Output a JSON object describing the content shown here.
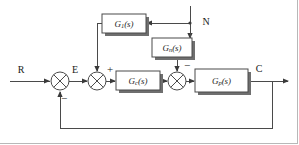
{
  "diagram": {
    "type": "control-system-block-diagram",
    "signals": {
      "reference": "R",
      "error": "E",
      "output": "C",
      "disturbance": "N"
    },
    "blocks": [
      {
        "id": "g1",
        "name": "feedforward-compensator-block",
        "label_main": "G",
        "label_sub": "1",
        "label_arg": "(s)",
        "x": 102,
        "y": 14,
        "w": 44,
        "h": 19
      },
      {
        "id": "gn",
        "name": "disturbance-transfer-block",
        "label_main": "G",
        "label_sub": "n",
        "label_arg": "(s)",
        "x": 152,
        "y": 38,
        "w": 40,
        "h": 19
      },
      {
        "id": "gc",
        "name": "controller-block",
        "label_main": "G",
        "label_sub": "c",
        "label_arg": "(s)",
        "x": 116,
        "y": 71,
        "w": 44,
        "h": 19
      },
      {
        "id": "gp",
        "name": "plant-block",
        "label_main": "G",
        "label_sub": "p",
        "label_arg": "(s)",
        "x": 195,
        "y": 69,
        "w": 53,
        "h": 23
      }
    ],
    "summing_junctions": [
      {
        "id": "sum1",
        "name": "error-summing-junction",
        "cx": 60,
        "cy": 81,
        "r": 9,
        "signs": [
          {
            "text": "−",
            "x": 64,
            "y": 99
          }
        ]
      },
      {
        "id": "sum2",
        "name": "feedforward-summing-junction",
        "cx": 97,
        "cy": 81,
        "r": 9,
        "signs": [
          {
            "text": "+",
            "x": 110,
            "y": 70
          }
        ]
      },
      {
        "id": "sum3",
        "name": "disturbance-summing-junction",
        "cx": 177,
        "cy": 81,
        "r": 9,
        "signs": [
          {
            "text": "−",
            "x": 187,
            "y": 66
          }
        ]
      }
    ],
    "signal_labels": [
      {
        "name": "reference-input-label",
        "text": "R",
        "x": 21,
        "y": 71
      },
      {
        "name": "error-signal-label",
        "text": "E",
        "x": 75,
        "y": 71
      },
      {
        "name": "disturbance-input-label",
        "text": "N",
        "x": 206,
        "y": 23
      },
      {
        "name": "output-signal-label",
        "text": "C",
        "x": 259,
        "y": 70
      }
    ],
    "colors": {
      "wire": "#4a4a4a",
      "block_stroke": "#4a4a4a",
      "block_fill": "#ffffff",
      "shadow": "#6f6f6f",
      "text": "#1a1a1a",
      "background": "#ffffff",
      "frame": "#b8b8b8"
    }
  }
}
